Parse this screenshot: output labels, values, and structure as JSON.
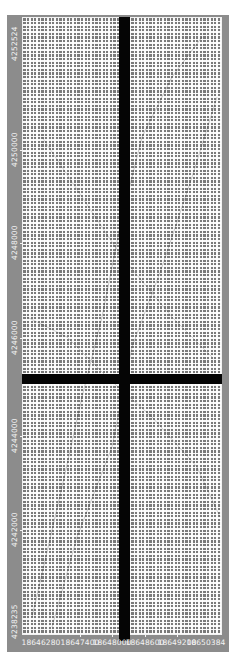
{
  "map": {
    "type": "coordinate-grid-viewer",
    "background_color": "#ffffff",
    "frame_color": "#8c8c8c",
    "grid_color": "#ffffff",
    "crosshair_color": "#050505",
    "y_axis": {
      "labels": [
        "4252524",
        "4250000",
        "4248000",
        "4246000",
        "4244000",
        "4242000",
        "4238235"
      ],
      "label_positions_px": [
        44,
        150,
        243,
        338,
        436,
        530,
        622
      ],
      "min": 4238235,
      "max": 4252524
    },
    "x_axis": {
      "labels": [
        "18646280",
        "18647400",
        "18648000",
        "18648600",
        "18649200",
        "18650384"
      ],
      "label_positions_px": [
        41,
        80,
        112,
        145,
        177,
        206
      ],
      "min": 18646280,
      "max": 18650384
    },
    "crosshair": {
      "vertical_x_px": 119,
      "vertical_width_px": 11,
      "horizontal_y_px": 374,
      "horizontal_height_px": 10
    }
  }
}
